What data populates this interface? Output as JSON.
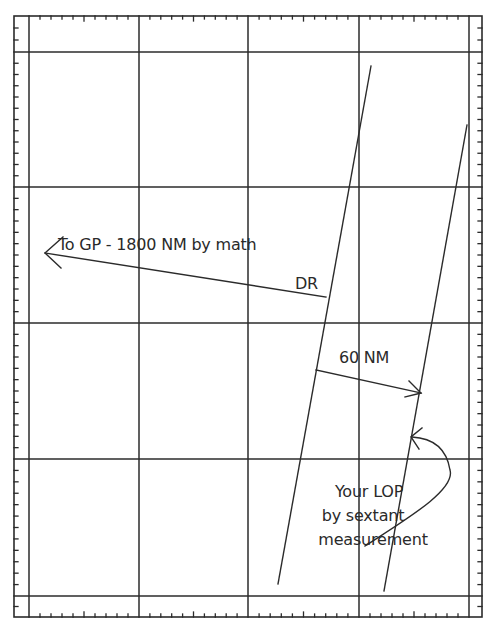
{
  "diagram": {
    "type": "celestial-navigation-plotting-sheet",
    "colors": {
      "line": "#2b2b2b",
      "background": "#ffffff",
      "text": "#2a2a2a"
    },
    "grid": {
      "columns": 4,
      "rows": 4
    },
    "labels": {
      "gp_direction": "To GP - 1800 NM by math",
      "dr": "DR",
      "distance": "60 NM",
      "lop_line1": "Your LOP",
      "lop_line2": "by sextant",
      "lop_line3": "measurement"
    },
    "elements": [
      {
        "name": "dr-line-of-position",
        "description": "Line through DR position"
      },
      {
        "name": "sextant-line-of-position",
        "description": "Your LOP by sextant measurement"
      },
      {
        "name": "gp-direction-arrow",
        "description": "Arrow pointing toward GP, 1800 NM"
      },
      {
        "name": "intercept-arrow",
        "description": "60 NM offset between the two lines"
      },
      {
        "name": "lop-callout-arrow",
        "description": "Curved arrow from caption to sextant LOP"
      }
    ]
  }
}
